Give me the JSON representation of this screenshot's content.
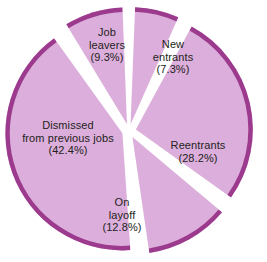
{
  "chart_data": {
    "type": "pie",
    "title": "",
    "subtitle": "",
    "xlabel": "",
    "ylabel": "",
    "legend_position": "none",
    "grid": false,
    "units": "percent",
    "exploded": true,
    "start_angle_deg": 0,
    "direction": "clockwise",
    "categories": [
      "New entrants",
      "Reentrants",
      "On layoff",
      "Dismissed from previous jobs",
      "Job leavers"
    ],
    "values": [
      7.3,
      28.2,
      12.8,
      42.4,
      9.3
    ],
    "slices": [
      {
        "name": "New entrants",
        "label_line1": "New",
        "label_line2": "entrants",
        "percent_label": "(7.3%)",
        "value": 7.3,
        "fill": "#dcaedb",
        "rim": "#9c3a8e"
      },
      {
        "name": "Reentrants",
        "label_line1": "Reentrants",
        "label_line2": "",
        "percent_label": "(28.2%)",
        "value": 28.2,
        "fill": "#dcaedb",
        "rim": "#9c3a8e"
      },
      {
        "name": "On layoff",
        "label_line1": "On",
        "label_line2": "layoff",
        "percent_label": "(12.8%)",
        "value": 12.8,
        "fill": "#dcaedb",
        "rim": "#9c3a8e"
      },
      {
        "name": "Dismissed from previous jobs",
        "label_line1": "Dismissed",
        "label_line2": "from previous jobs",
        "percent_label": "(42.4%)",
        "value": 42.4,
        "fill": "#dcaedb",
        "rim": "#9c3a8e"
      },
      {
        "name": "Job leavers",
        "label_line1": "Job",
        "label_line2": "leavers",
        "percent_label": "(9.3%)",
        "value": 9.3,
        "fill": "#dcaedb",
        "rim": "#9c3a8e"
      }
    ],
    "colors": {
      "slice_fill": "#dcaedb",
      "slice_rim": "#9c3a8e",
      "background": "#ffffff",
      "label_text": "#231f20"
    }
  }
}
